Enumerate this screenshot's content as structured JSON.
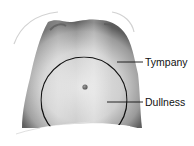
{
  "figure": {
    "labels": [
      {
        "id": "tympany",
        "text": "Tympany"
      },
      {
        "id": "dullness",
        "text": "Dullness"
      }
    ],
    "colors": {
      "background": "#ffffff",
      "skin_dark": "#6e6e6e",
      "skin_mid": "#a8a8a8",
      "skin_light": "#d8d8d8",
      "outline": "#111111"
    }
  }
}
